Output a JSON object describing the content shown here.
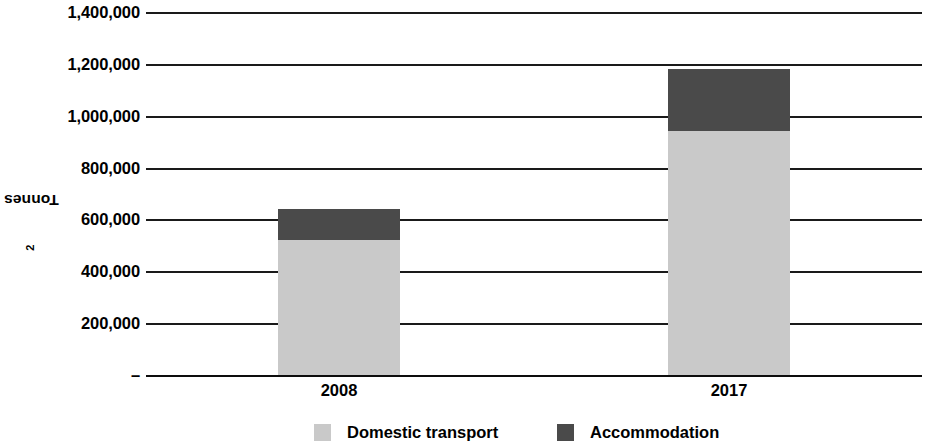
{
  "chart_data": {
    "type": "bar",
    "subtype": "stacked-bar",
    "title": "",
    "xlabel": "",
    "ylabel": "Tonnes of CO2",
    "ylabel_display": "Tonnes of CO",
    "ylabel_subscript": "2",
    "categories": [
      "2008",
      "2017"
    ],
    "series": [
      {
        "name": "Domestic transport",
        "color": "#c9c9c9",
        "values": [
          520000,
          940000
        ]
      },
      {
        "name": "Accommodation",
        "color": "#4a4a4a",
        "values": [
          120000,
          240000
        ]
      }
    ],
    "totals": [
      640000,
      1180000
    ],
    "ylim": [
      0,
      1400000
    ],
    "ytick_values": [
      1400000,
      1200000,
      1000000,
      800000,
      600000,
      400000,
      200000,
      0
    ],
    "ytick_labels": [
      "1,400,000",
      "1,200,000",
      "1,000,000",
      "800,000",
      "600,000",
      "400,000",
      "200,000",
      "–"
    ],
    "grid": true,
    "grid_axis": "y",
    "legend_position": "bottom"
  },
  "axis": {
    "y_title_text": "Tonnes of CO",
    "y_title_sub": "2"
  },
  "legend": {
    "items": [
      {
        "label": "Domestic transport",
        "color": "#c9c9c9"
      },
      {
        "label": "Accommodation",
        "color": "#4a4a4a"
      }
    ]
  },
  "geometry": {
    "baseline_y": 375,
    "pixels_per_200k": 51.9,
    "bars": [
      {
        "category": "2008",
        "left": 278,
        "width": 122
      },
      {
        "category": "2017",
        "left": 668,
        "width": 122
      }
    ],
    "legend_items": [
      {
        "left": 314
      },
      {
        "left": 557
      }
    ],
    "x_labels": [
      {
        "center": 339
      },
      {
        "center": 729
      }
    ]
  }
}
